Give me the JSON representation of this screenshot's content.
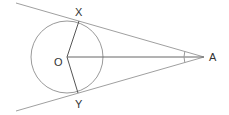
{
  "diagram": {
    "type": "geometry",
    "colors": {
      "line": "#9a9a9a",
      "radius": "#555555",
      "label": "#333333",
      "background": "#ffffff"
    },
    "labels": {
      "center": "O",
      "tangent_point_top": "X",
      "tangent_point_bottom": "Y",
      "external_point": "A"
    },
    "points": {
      "O": [
        67,
        57
      ],
      "X": [
        79,
        21
      ],
      "Y": [
        78,
        93
      ],
      "A": [
        204,
        57
      ]
    },
    "circle": {
      "cx": 67,
      "cy": 57,
      "r": 36
    },
    "segments": [
      {
        "from": "O",
        "to": "X"
      },
      {
        "from": "O",
        "to": "Y"
      },
      {
        "from": "O",
        "to": "A"
      },
      {
        "from": "A",
        "to": "X",
        "extended": true
      },
      {
        "from": "A",
        "to": "Y",
        "extended": true
      }
    ],
    "angle_marker": {
      "at": "A",
      "radius": 20
    }
  }
}
